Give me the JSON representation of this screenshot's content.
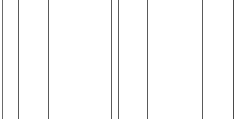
{
  "canvas": {
    "width": 242,
    "height": 119,
    "background_color": "#ffffff",
    "description": "Blank white canvas crossed by thin vertical gray rules spanning full height"
  },
  "chart_data": {
    "type": "line",
    "title": "",
    "subtitle": "",
    "xlabel": "",
    "ylabel": "",
    "grid": true,
    "legend_position": "none",
    "orientation": "vertical",
    "axis_ranges": {
      "x": [
        0,
        242
      ],
      "y": [
        0,
        119
      ]
    },
    "tick_labels": [],
    "annotations": [],
    "series": [
      {
        "name": "vertical-rules",
        "color": "#5a5a5a",
        "line_width": 1,
        "x": [
          2,
          18,
          48,
          111,
          118,
          147,
          202,
          233
        ],
        "y_top": 0,
        "y_bottom": 119,
        "values": [
          2,
          18,
          48,
          111,
          118,
          147,
          202,
          233
        ]
      }
    ]
  },
  "lines": [
    {
      "id": "rule-1",
      "x": 2,
      "width": 1,
      "color": "#6a6a6a"
    },
    {
      "id": "rule-2",
      "x": 18,
      "width": 1,
      "color": "#5a5a5a"
    },
    {
      "id": "rule-3",
      "x": 48,
      "width": 1,
      "color": "#5a5a5a"
    },
    {
      "id": "rule-4",
      "x": 111,
      "width": 1,
      "color": "#5a5a5a"
    },
    {
      "id": "rule-5",
      "x": 118,
      "width": 1,
      "color": "#5a5a5a"
    },
    {
      "id": "rule-6",
      "x": 147,
      "width": 1,
      "color": "#5a5a5a"
    },
    {
      "id": "rule-7",
      "x": 202,
      "width": 1,
      "color": "#5a5a5a"
    },
    {
      "id": "rule-8",
      "x": 233,
      "width": 1,
      "color": "#4a4a4a"
    }
  ]
}
